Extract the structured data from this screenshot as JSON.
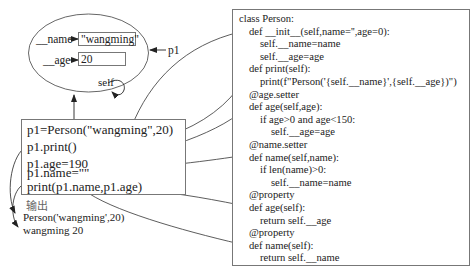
{
  "object": {
    "name_label": "__name",
    "name_value": "\"wangming\"",
    "age_label": "__age",
    "age_value": "20",
    "ref_label": "p1",
    "self_label": "self"
  },
  "client_code": {
    "lines": [
      "p1=Person(\"wangming\",20)",
      "p1.print()",
      "p1.age=190",
      "p1.name=\"\"",
      "print(p1.name,p1.age)"
    ]
  },
  "output": {
    "label": "输出",
    "lines": [
      "Person('wangming',20)",
      "wangming 20"
    ]
  },
  "class_code": {
    "lines": [
      {
        "text": "class Person:",
        "indent": 0
      },
      {
        "text": "def __init__(self,name='',age=0):",
        "indent": 1
      },
      {
        "text": "self.__name=name",
        "indent": 2
      },
      {
        "text": "self.__age=age",
        "indent": 2
      },
      {
        "text": "def print(self):",
        "indent": 1
      },
      {
        "text": "print(f\"Person('{self.__name}',{self.__age})\")",
        "indent": 2
      },
      {
        "text": "@age.setter",
        "indent": 1
      },
      {
        "text": "def age(self,age):",
        "indent": 1
      },
      {
        "text": "if age>0 and age<150:",
        "indent": 2
      },
      {
        "text": "self.__age=age",
        "indent": 3
      },
      {
        "text": "@name.setter",
        "indent": 1
      },
      {
        "text": "def name(self,name):",
        "indent": 1
      },
      {
        "text": "if len(name)>0:",
        "indent": 2
      },
      {
        "text": "self.__name=name",
        "indent": 3
      },
      {
        "text": "@property",
        "indent": 1
      },
      {
        "text": "def age(self):",
        "indent": 1
      },
      {
        "text": "return self.__age",
        "indent": 2
      },
      {
        "text": "@property",
        "indent": 1
      },
      {
        "text": "def name(self):",
        "indent": 1
      },
      {
        "text": "return self.__name",
        "indent": 2
      }
    ]
  },
  "colors": {
    "stroke": "#555555",
    "box_border": "#777777",
    "text": "#222222"
  }
}
